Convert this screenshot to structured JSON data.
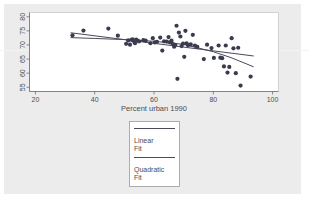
{
  "chart_data": {
    "type": "scatter",
    "title": "",
    "subtitle": "",
    "xlabel": "Percent urban 1990",
    "ylabel": "",
    "xlim": [
      18,
      102
    ],
    "ylim": [
      53.5,
      81.5
    ],
    "xticks": [
      20,
      40,
      60,
      80,
      100
    ],
    "yticks": [
      55,
      60,
      65,
      70,
      75,
      80
    ],
    "xtick_labels": [
      "20",
      "40",
      "60",
      "80",
      "100"
    ],
    "ytick_labels": [
      "55",
      "60",
      "65",
      "70",
      "75",
      "80"
    ],
    "grid": false,
    "legend_position": "below-plot",
    "marker_color": "#3b3b4f",
    "line_color": "#4a4a5a",
    "panel_color": "#ffffff",
    "background_color": "#ececec",
    "points": [
      {
        "x": 32.5,
        "y": 73.4
      },
      {
        "x": 36.2,
        "y": 75.1
      },
      {
        "x": 44.6,
        "y": 75.8
      },
      {
        "x": 47.8,
        "y": 73.3
      },
      {
        "x": 50.6,
        "y": 70.4
      },
      {
        "x": 51.3,
        "y": 71.6
      },
      {
        "x": 51.9,
        "y": 70.1
      },
      {
        "x": 52.4,
        "y": 71.8
      },
      {
        "x": 52.8,
        "y": 72.0
      },
      {
        "x": 53.1,
        "y": 71.4
      },
      {
        "x": 53.6,
        "y": 70.6
      },
      {
        "x": 54.0,
        "y": 71.9
      },
      {
        "x": 54.4,
        "y": 71.5
      },
      {
        "x": 55.0,
        "y": 71.3
      },
      {
        "x": 56.4,
        "y": 71.7
      },
      {
        "x": 57.2,
        "y": 71.5
      },
      {
        "x": 58.8,
        "y": 70.6
      },
      {
        "x": 59.6,
        "y": 72.4
      },
      {
        "x": 60.3,
        "y": 70.9
      },
      {
        "x": 61.0,
        "y": 71.1
      },
      {
        "x": 62.1,
        "y": 72.6
      },
      {
        "x": 62.8,
        "y": 68.0
      },
      {
        "x": 63.4,
        "y": 71.3
      },
      {
        "x": 64.3,
        "y": 71.2
      },
      {
        "x": 64.9,
        "y": 72.8
      },
      {
        "x": 65.4,
        "y": 70.9
      },
      {
        "x": 65.9,
        "y": 71.5
      },
      {
        "x": 66.4,
        "y": 70.3
      },
      {
        "x": 66.8,
        "y": 69.4
      },
      {
        "x": 67.2,
        "y": 70.0
      },
      {
        "x": 67.6,
        "y": 76.8
      },
      {
        "x": 67.9,
        "y": 58.0
      },
      {
        "x": 68.4,
        "y": 74.4
      },
      {
        "x": 68.9,
        "y": 73.0
      },
      {
        "x": 69.3,
        "y": 69.6
      },
      {
        "x": 69.8,
        "y": 70.5
      },
      {
        "x": 70.2,
        "y": 65.8
      },
      {
        "x": 70.6,
        "y": 75.0
      },
      {
        "x": 71.0,
        "y": 70.6
      },
      {
        "x": 71.5,
        "y": 69.9
      },
      {
        "x": 72.4,
        "y": 70.2
      },
      {
        "x": 73.1,
        "y": 73.6
      },
      {
        "x": 73.8,
        "y": 69.8
      },
      {
        "x": 74.6,
        "y": 69.3
      },
      {
        "x": 76.8,
        "y": 65.0
      },
      {
        "x": 77.9,
        "y": 70.1
      },
      {
        "x": 79.4,
        "y": 68.9
      },
      {
        "x": 80.2,
        "y": 65.4
      },
      {
        "x": 81.8,
        "y": 69.8
      },
      {
        "x": 82.4,
        "y": 65.5
      },
      {
        "x": 83.0,
        "y": 65.3
      },
      {
        "x": 83.6,
        "y": 62.4
      },
      {
        "x": 84.2,
        "y": 69.8
      },
      {
        "x": 84.8,
        "y": 60.2
      },
      {
        "x": 85.4,
        "y": 62.2
      },
      {
        "x": 86.2,
        "y": 72.4
      },
      {
        "x": 86.8,
        "y": 68.8
      },
      {
        "x": 87.6,
        "y": 60.0
      },
      {
        "x": 88.4,
        "y": 69.0
      },
      {
        "x": 89.2,
        "y": 55.6
      },
      {
        "x": 92.6,
        "y": 58.8
      }
    ],
    "series": [
      {
        "name": "Linear Fit",
        "type": "line",
        "x": [
          32.0,
          93.5
        ],
        "y": [
          74.3,
          66.1
        ]
      },
      {
        "name": "Quadratic Fit",
        "type": "line",
        "x": [
          32.0,
          40.0,
          50.0,
          60.0,
          70.0,
          80.0,
          86.0,
          93.5
        ],
        "y": [
          72.6,
          72.3,
          71.9,
          71.3,
          70.2,
          67.6,
          65.5,
          62.3
        ]
      }
    ]
  },
  "legend": {
    "entries": [
      {
        "label_line1": "Linear",
        "label_line2": "Fit"
      },
      {
        "label_line1": "Quadratic",
        "label_line2": "Fit"
      }
    ]
  }
}
